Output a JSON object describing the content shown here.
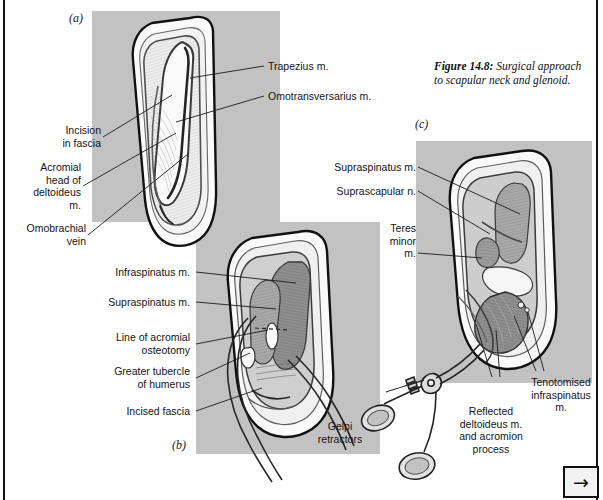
{
  "figure": {
    "number": "Figure 14.8:",
    "caption": " Surgical approach to scapular neck and glenoid."
  },
  "panels": [
    {
      "id": "a",
      "letter": "(a)"
    },
    {
      "id": "b",
      "letter": "(b)"
    },
    {
      "id": "c",
      "letter": "(c)"
    }
  ],
  "labels": {
    "trapezius": "Trapezius m.",
    "omotransversarius": "Omotransversarius m.",
    "incision_in_fascia": "Incision\nin fascia",
    "acromial_head_deltoideus": "Acromial\nhead of\ndeltoideus\nm.",
    "omobrachial_vein": "Omobrachial\nvein",
    "infraspinatus": "Infraspinatus m.",
    "supraspinatus_b": "Supraspinatus m.",
    "line_of_acromial_osteotomy": "Line of acromial\nosteotomy",
    "greater_tubercle_of_humerus": "Greater tubercle\nof humerus",
    "incised_fascia": "Incised fascia",
    "gelpi_retractors": "Gelpi\nretractors",
    "supraspinatus_c": "Supraspinatus m.",
    "suprascapular_n": "Suprascapular n.",
    "teres_minor": "Teres\nminor\nm.",
    "reflected_deltoideus": "Reflected\ndeltoideus m.\nand acromion\nprocess",
    "tenotomised_infraspinatus": "Tenotomised\ninfraspinatus\nm."
  },
  "navigation": {
    "next_glyph": "→"
  },
  "colors": {
    "panel_gray": "#c2c2c2",
    "page_white": "#ffffff",
    "ink": "#111111",
    "muscle_dark": "#8d8d8d",
    "muscle_mid": "#a8a8a8",
    "tissue_light": "#efefef",
    "instrument": "#d9d9d9"
  }
}
